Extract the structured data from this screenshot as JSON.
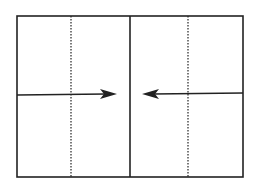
{
  "diagram": {
    "type": "folding-diagram",
    "colors": {
      "line": "#222222",
      "background": "#ffffff"
    },
    "outer_rect": {
      "x": 16,
      "y": 15,
      "width": 228,
      "height": 163
    },
    "center_line_x": 130,
    "dotted_lines_x": [
      71,
      188
    ],
    "arrows": [
      {
        "name": "left-arrow",
        "direction": "right",
        "y": 95,
        "from_x": 16,
        "to_x": 117
      },
      {
        "name": "right-arrow",
        "direction": "left",
        "y": 93,
        "from_x": 244,
        "to_x": 142
      }
    ]
  }
}
